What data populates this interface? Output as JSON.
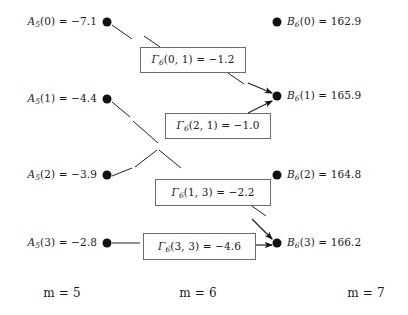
{
  "figure": {
    "type": "trellis-diagram",
    "background_color": "#ffffff",
    "node_color": "#111111",
    "box_border_color": "#6b6b6b",
    "edge_color": "#222222"
  },
  "left_column": {
    "stage_label": {
      "var": "m",
      "eq": " = ",
      "value": "5"
    },
    "nodes": [
      {
        "symbol": "A",
        "subscript": "5",
        "index": "(0)",
        "eq": " = ",
        "value": "−7.1",
        "text": "A₅(0) = −7.1",
        "x": 107,
        "y": 22
      },
      {
        "symbol": "A",
        "subscript": "5",
        "index": "(1)",
        "eq": " = ",
        "value": "−4.4",
        "text": "A₅(1) = −4.4",
        "x": 107,
        "y": 99
      },
      {
        "symbol": "A",
        "subscript": "5",
        "index": "(2)",
        "eq": " = ",
        "value": "−3.9",
        "text": "A₅(2) = −3.9",
        "x": 107,
        "y": 175
      },
      {
        "symbol": "A",
        "subscript": "5",
        "index": "(3)",
        "eq": " = ",
        "value": "−2.8",
        "text": "A₅(3) = −2.8",
        "x": 107,
        "y": 243
      }
    ]
  },
  "right_column": {
    "stage_label": {
      "var": "m",
      "eq": " = ",
      "value": "7"
    },
    "nodes": [
      {
        "symbol": "B",
        "subscript": "6",
        "index": "(0)",
        "eq": " = ",
        "value": "162.9",
        "text": "B₆(0) = 162.9",
        "x": 277,
        "y": 22
      },
      {
        "symbol": "B",
        "subscript": "6",
        "index": "(1)",
        "eq": " = ",
        "value": "165.9",
        "text": "B₆(1) = 165.9",
        "x": 277,
        "y": 96
      },
      {
        "symbol": "B",
        "subscript": "6",
        "index": "(2)",
        "eq": " = ",
        "value": "164.8",
        "text": "B₆(2) = 164.8",
        "x": 277,
        "y": 175
      },
      {
        "symbol": "B",
        "subscript": "6",
        "index": "(3)",
        "eq": " = ",
        "value": "166.2",
        "text": "B₆(3) = 166.2",
        "x": 277,
        "y": 243
      }
    ]
  },
  "middle_column": {
    "stage_label": {
      "var": "m",
      "eq": " = ",
      "value": "6"
    },
    "boxes": [
      {
        "symbol": "Γ",
        "subscript": "6",
        "args": "(0, 1)",
        "eq": " = ",
        "value": "−1.2",
        "text": "Γ₆(0, 1) = −1.2",
        "x": 140,
        "y": 47,
        "w": 106,
        "h": 26
      },
      {
        "symbol": "Γ",
        "subscript": "6",
        "args": "(2, 1)",
        "eq": " = ",
        "value": "−1.0",
        "text": "Γ₆(2, 1) = −1.0",
        "x": 165,
        "y": 113,
        "w": 106,
        "h": 26
      },
      {
        "symbol": "Γ",
        "subscript": "6",
        "args": "(1, 3)",
        "eq": " = ",
        "value": "−2.2",
        "text": "Γ₆(1, 3) = −2.2",
        "x": 155,
        "y": 179,
        "w": 116,
        "h": 27
      },
      {
        "symbol": "Γ",
        "subscript": "6",
        "args": "(3, 3)",
        "eq": " = ",
        "value": "−4.6",
        "text": "Γ₆(3, 3) = −4.6",
        "x": 143,
        "y": 233,
        "w": 113,
        "h": 27
      }
    ]
  },
  "edges": [
    {
      "name": "a0-to-gamma01",
      "from": "A5(0)",
      "to": "gamma_6_0_1",
      "x1": 112,
      "y1": 25,
      "x2": 132,
      "y2": 39,
      "arrow": false
    },
    {
      "name": "gamma01-entry",
      "from": "path",
      "to": "gamma_6_0_1",
      "x1": 144,
      "y1": 36,
      "x2": 160,
      "y2": 47,
      "arrow": false
    },
    {
      "name": "gamma01-exit",
      "from": "gamma_6_0_1",
      "to": "b1-approach",
      "x1": 228,
      "y1": 73,
      "x2": 244,
      "y2": 84,
      "arrow": false
    },
    {
      "name": "gamma01-to-b1",
      "from": "gamma_6_0_1",
      "to": "B6(1)",
      "x1": 248,
      "y1": 83,
      "x2": 272,
      "y2": 93,
      "arrow": true
    },
    {
      "name": "a1-down",
      "from": "A5(1)",
      "to": "crossing",
      "x1": 112,
      "y1": 102,
      "x2": 130,
      "y2": 117,
      "arrow": false
    },
    {
      "name": "cross-upper",
      "from": "crossing",
      "to": "gamma21",
      "x1": 133,
      "y1": 121,
      "x2": 158,
      "y2": 143,
      "arrow": false
    },
    {
      "name": "cross-lower-left",
      "from": "crossing",
      "to": "a2-side",
      "x1": 135,
      "y1": 167,
      "x2": 157,
      "y2": 150,
      "arrow": false
    },
    {
      "name": "cross-lower-right",
      "from": "crossing",
      "to": "gamma13",
      "x1": 159,
      "y1": 150,
      "x2": 181,
      "y2": 168,
      "arrow": false
    },
    {
      "name": "gamma21-exit",
      "from": "gamma_6_2_1",
      "to": "b1-approach2",
      "x1": 253,
      "y1": 139,
      "x2": 268,
      "y2": 127,
      "arrow": false
    },
    {
      "name": "gamma21-to-b1",
      "from": "gamma_6_2_1",
      "to": "B6(1)",
      "x1": 248,
      "y1": 113,
      "x2": 272,
      "y2": 101,
      "arrow": true
    },
    {
      "name": "a2-to-crossing",
      "from": "A5(2)",
      "to": "crossing",
      "x1": 112,
      "y1": 176,
      "x2": 132,
      "y2": 168,
      "arrow": false
    },
    {
      "name": "gamma13-exit",
      "from": "gamma_6_1_3",
      "to": "b3-approach",
      "x1": 252,
      "y1": 206,
      "x2": 266,
      "y2": 216,
      "arrow": false
    },
    {
      "name": "gamma13-to-b3",
      "from": "gamma_6_1_3",
      "to": "B6(3)",
      "x1": 252,
      "y1": 219,
      "x2": 272,
      "y2": 239,
      "arrow": true
    },
    {
      "name": "a3-to-gamma33",
      "from": "A5(3)",
      "to": "gamma_6_3_3",
      "x1": 112,
      "y1": 243,
      "x2": 140,
      "y2": 243,
      "arrow": false
    },
    {
      "name": "gamma33-to-b3",
      "from": "gamma_6_3_3",
      "to": "B6(3)",
      "x1": 256,
      "y1": 245,
      "x2": 272,
      "y2": 245,
      "arrow": true
    }
  ]
}
